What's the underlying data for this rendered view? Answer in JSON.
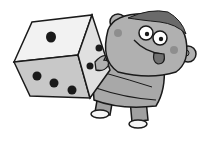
{
  "image": {
    "description": "Grayscale cartoon of a smiling character with tongue out holding a large die",
    "style": "grayscale line art illustration",
    "subjects": [
      {
        "name": "die",
        "faces_visible": {
          "top": 1,
          "front": 3,
          "right": 2
        }
      },
      {
        "name": "character",
        "expression": "googly eyes, tongue out, rosy cheeks"
      }
    ]
  },
  "colors": {
    "background": "#ffffff",
    "outline": "#1a1a1a",
    "die_top": "#f2f2f2",
    "die_front": "#c8c8c8",
    "die_right": "#e0e0e0",
    "pip": "#1a1a1a",
    "skin": "#b0b0b0",
    "hair": "#6a6a6a",
    "shirt": "#a8a8a8",
    "pants": "#9a9a9a",
    "cheek": "#808080",
    "tongue": "#707070",
    "shoe": "#f5f5f5"
  }
}
